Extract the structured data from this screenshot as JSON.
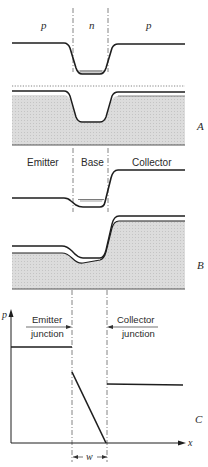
{
  "figure": {
    "panel_a": {
      "label": "A",
      "regions": [
        "p",
        "n",
        "p"
      ]
    },
    "panel_b": {
      "label": "B",
      "regions": [
        "Emitter",
        "Base",
        "Collector"
      ]
    },
    "panel_c": {
      "label": "C",
      "y_axis_label": "p",
      "x_axis_label": "x",
      "emitter_junction_label_line1": "Emitter",
      "emitter_junction_label_line2": "junction",
      "collector_junction_label_line1": "Collector",
      "collector_junction_label_line2": "junction",
      "width_label": "w"
    },
    "colors": {
      "line": "#1e1e1e",
      "shade": "#d6d6d6",
      "dash": "#555555"
    }
  }
}
